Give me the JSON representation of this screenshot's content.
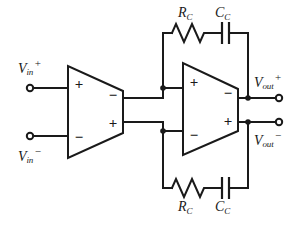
{
  "diagram": {
    "background_color": "#ffffff",
    "line_color": "#1a1a1a"
  },
  "inputs": [
    {
      "id": "vin-plus",
      "var": "V",
      "subscript": "in",
      "superscript": "+",
      "terminal": "open-circle"
    },
    {
      "id": "vin-minus",
      "var": "V",
      "subscript": "in",
      "superscript": "−",
      "terminal": "open-circle"
    }
  ],
  "outputs": [
    {
      "id": "vout-plus",
      "var": "V",
      "subscript": "out",
      "superscript": "+",
      "terminal": "open-circle"
    },
    {
      "id": "vout-minus",
      "var": "V",
      "subscript": "out",
      "superscript": "−",
      "terminal": "open-circle"
    }
  ],
  "amplifiers": [
    {
      "id": "stage-1",
      "input_top": "+",
      "input_bottom": "−",
      "output_top": "−",
      "output_bottom": "+"
    },
    {
      "id": "stage-2",
      "input_top": "+",
      "input_bottom": "−",
      "output_top": "−",
      "output_bottom": "+"
    }
  ],
  "components": [
    {
      "id": "rc-top",
      "type": "resistor",
      "var": "R",
      "subscript": "C",
      "label_position": "above"
    },
    {
      "id": "cc-top",
      "type": "capacitor",
      "var": "C",
      "subscript": "C",
      "label_position": "above"
    },
    {
      "id": "rc-bottom",
      "type": "resistor",
      "var": "R",
      "subscript": "C",
      "label_position": "below"
    },
    {
      "id": "cc-bottom",
      "type": "capacitor",
      "var": "C",
      "subscript": "C",
      "label_position": "below"
    }
  ],
  "polarity_glyphs": {
    "plus": "+",
    "minus": "−"
  }
}
